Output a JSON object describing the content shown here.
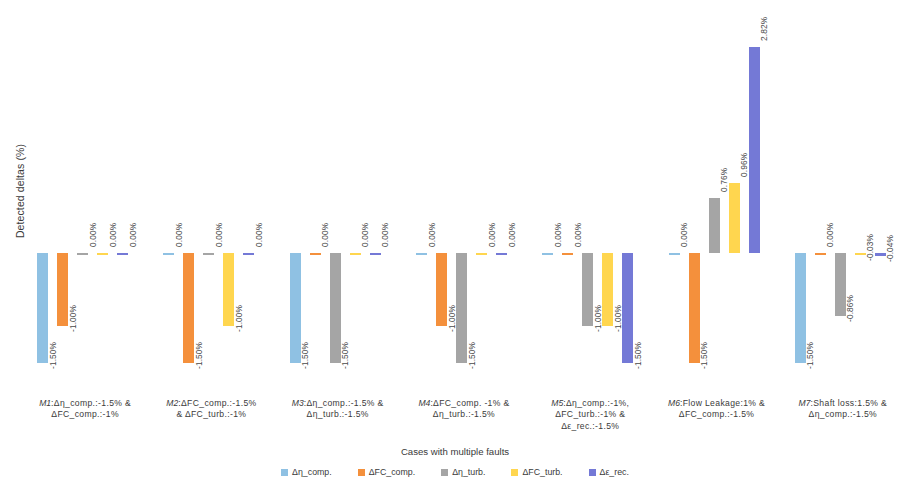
{
  "chart_data": {
    "type": "bar",
    "title": "",
    "xlabel": "Cases with multiple faults",
    "ylabel": "Detected deltas (%)",
    "ylim": [
      -1.5,
      2.82
    ],
    "grid": false,
    "legend_position": "bottom",
    "value_label_format": "0.00%",
    "categories": [
      "M1:Δη_comp.:-1.5% & ΔFC_comp.:-1%",
      "M2:ΔFC_comp.:-1.5% & ΔFC_turb.:-1%",
      "M3:Δη_comp.:-1.5% & Δη_turb.:-1.5%",
      "M4:ΔFC_comp. -1% & Δη_turb.:-1.5%",
      "M5:Δη_comp.:-1%, ΔFC_turb.:-1% & Δε_rec.:-1.5%",
      "M6:Flow Leakage:1% & ΔFC_comp.:-1.5%",
      "M7:Shaft loss:1.5% & Δη_comp.:-1.5%"
    ],
    "category_lines": [
      [
        "M1",
        ":Δη_comp.:-1.5% &",
        "ΔFC_comp.:-1%"
      ],
      [
        "M2",
        ":ΔFC_comp.:-1.5%",
        "& ΔFC_turb.:-1%"
      ],
      [
        "M3",
        ":Δη_comp.:-1.5% &",
        "Δη_turb.:-1.5%"
      ],
      [
        "M4",
        ":ΔFC_comp. -1% &",
        "Δη_turb.:-1.5%"
      ],
      [
        "M5",
        ":Δη_comp.:-1%,",
        "ΔFC_turb.:-1% &",
        "Δε_rec.:-1.5%"
      ],
      [
        "M6",
        ":Flow Leakage:1% &",
        "ΔFC_comp.:-1.5%"
      ],
      [
        "M7",
        ":Shaft loss:1.5% &",
        "Δη_comp.:-1.5%"
      ]
    ],
    "series": [
      {
        "name": "Δη_comp.",
        "color": "#8FC1E3",
        "values": [
          -1.5,
          0.0,
          -1.5,
          0.0,
          0.0,
          0.0,
          -1.5
        ],
        "labels": [
          "-1.50%",
          "0.00%",
          "-1.50%",
          "0.00%",
          "0.00%",
          "0.00%",
          "-1.50%"
        ]
      },
      {
        "name": "ΔFC_comp.",
        "color": "#F4903C",
        "values": [
          -1.0,
          -1.5,
          0.0,
          -1.0,
          0.0,
          -1.5,
          0.0
        ],
        "labels": [
          "-1.00%",
          "-1.50%",
          "0.00%",
          "-1.00%",
          "0.00%",
          "-1.50%",
          "0.00%"
        ]
      },
      {
        "name": "Δη_turb.",
        "color": "#A5A5A5",
        "values": [
          0.0,
          0.0,
          -1.5,
          -1.5,
          -1.0,
          0.76,
          -0.86
        ],
        "labels": [
          "0.00%",
          "0.00%",
          "-1.50%",
          "-1.50%",
          "-1.00%",
          "0.76%",
          "-0.86%"
        ]
      },
      {
        "name": "ΔFC_turb.",
        "color": "#FFD64F",
        "values": [
          0.0,
          -1.0,
          0.0,
          0.0,
          -1.0,
          0.96,
          -0.03
        ],
        "labels": [
          "0.00%",
          "-1.00%",
          "0.00%",
          "0.00%",
          "-1.00%",
          "0.96%",
          "-0.03%"
        ]
      },
      {
        "name": "Δε_rec.",
        "color": "#7479D6",
        "values": [
          0.0,
          0.0,
          0.0,
          0.0,
          -1.5,
          2.82,
          -0.04
        ],
        "labels": [
          "0.00%",
          "0.00%",
          "0.00%",
          "0.00%",
          "-1.50%",
          "2.82%",
          "-0.04%"
        ]
      }
    ]
  },
  "legend": {
    "items": [
      {
        "label": "Δη_comp.",
        "color": "#8FC1E3"
      },
      {
        "label": "ΔFC_comp.",
        "color": "#F4903C"
      },
      {
        "label": "Δη_turb.",
        "color": "#A5A5A5"
      },
      {
        "label": "ΔFC_turb.",
        "color": "#FFD64F"
      },
      {
        "label": "Δε_rec.",
        "color": "#7479D6"
      }
    ]
  }
}
